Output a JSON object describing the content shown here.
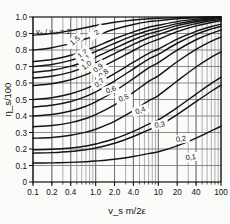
{
  "chart_data": {
    "type": "line",
    "title": "",
    "xlabel": "v_s m/2ε",
    "ylabel": "η_s/100",
    "xscale": "log",
    "xlim": [
      0.1,
      100
    ],
    "ylim": [
      0,
      1.0
    ],
    "grid": true,
    "legend_position": "inline-curve-labels",
    "legend_title": "vₛ / vₛₜ = 2",
    "xticks": [
      "0.1",
      "0.2",
      "0.4",
      "1.0",
      "2.0",
      "4.0",
      "10",
      "20",
      "40",
      "100"
    ],
    "xtick_values": [
      0.1,
      0.2,
      0.4,
      1.0,
      2.0,
      4.0,
      10,
      20,
      40,
      100
    ],
    "yticks": [
      "0",
      "0.1",
      "0.2",
      "0.3",
      "0.4",
      "0.5",
      "0.6",
      "0.7",
      "0.8",
      "0.9",
      "1.0"
    ],
    "ytick_values": [
      0,
      0.1,
      0.2,
      0.3,
      0.4,
      0.5,
      0.6,
      0.7,
      0.8,
      0.9,
      1.0
    ],
    "series": [
      {
        "name": "2",
        "label": "2",
        "label_x": 1.05,
        "label_y": 0.905,
        "x": [
          0.1,
          0.2,
          0.4,
          0.7,
          1.0,
          2.0,
          4.0,
          7.0,
          10,
          20,
          40,
          70,
          100
        ],
        "values": [
          0.89,
          0.9,
          0.918,
          0.936,
          0.948,
          0.968,
          0.982,
          0.989,
          0.992,
          0.996,
          0.999,
          1.0,
          1.0
        ]
      },
      {
        "name": "1.5",
        "label": "1,5",
        "label_x": 0.47,
        "label_y": 0.855,
        "x": [
          0.1,
          0.2,
          0.4,
          0.7,
          1.0,
          2.0,
          4.0,
          7.0,
          10,
          20,
          40,
          70,
          100
        ],
        "values": [
          0.8,
          0.814,
          0.84,
          0.868,
          0.888,
          0.926,
          0.955,
          0.972,
          0.978,
          0.989,
          0.996,
          0.999,
          1.0
        ]
      },
      {
        "name": "1.2",
        "label": "1,2",
        "label_x": 0.62,
        "label_y": 0.775,
        "x": [
          0.1,
          0.2,
          0.4,
          0.7,
          1.0,
          2.0,
          4.0,
          7.0,
          10,
          20,
          40,
          70,
          100
        ],
        "values": [
          0.73,
          0.742,
          0.768,
          0.798,
          0.82,
          0.868,
          0.91,
          0.938,
          0.95,
          0.972,
          0.987,
          0.995,
          0.998
        ]
      },
      {
        "name": "1.1",
        "label": "1,1",
        "label_x": 0.7,
        "label_y": 0.742,
        "x": [
          0.1,
          0.2,
          0.4,
          0.7,
          1.0,
          2.0,
          4.0,
          7.0,
          10,
          20,
          40,
          70,
          100
        ],
        "values": [
          0.7,
          0.712,
          0.737,
          0.767,
          0.79,
          0.84,
          0.887,
          0.918,
          0.932,
          0.96,
          0.979,
          0.99,
          0.995
        ]
      },
      {
        "name": "1.0",
        "label": "1,0",
        "label_x": 0.72,
        "label_y": 0.706,
        "x": [
          0.1,
          0.2,
          0.4,
          0.7,
          1.0,
          2.0,
          4.0,
          7.0,
          10,
          20,
          40,
          70,
          100
        ],
        "values": [
          0.665,
          0.677,
          0.702,
          0.733,
          0.757,
          0.81,
          0.862,
          0.898,
          0.914,
          0.948,
          0.971,
          0.985,
          0.991
        ]
      },
      {
        "name": "0.9",
        "label": "0,9",
        "label_x": 1.1,
        "label_y": 0.69,
        "x": [
          0.1,
          0.2,
          0.4,
          0.7,
          1.0,
          2.0,
          4.0,
          7.0,
          10,
          20,
          40,
          70,
          100
        ],
        "values": [
          0.63,
          0.641,
          0.666,
          0.697,
          0.722,
          0.778,
          0.834,
          0.874,
          0.893,
          0.932,
          0.96,
          0.977,
          0.985
        ]
      },
      {
        "name": "0.8",
        "label": "0,8",
        "label_x": 1.35,
        "label_y": 0.655,
        "x": [
          0.1,
          0.2,
          0.4,
          0.7,
          1.0,
          2.0,
          4.0,
          7.0,
          10,
          20,
          40,
          70,
          100
        ],
        "values": [
          0.585,
          0.596,
          0.62,
          0.651,
          0.677,
          0.736,
          0.797,
          0.843,
          0.864,
          0.911,
          0.946,
          0.967,
          0.977
        ]
      },
      {
        "name": "0.7",
        "label": "0,7",
        "label_x": 1.15,
        "label_y": 0.6,
        "x": [
          0.1,
          0.2,
          0.4,
          0.7,
          1.0,
          2.0,
          4.0,
          7.0,
          10,
          20,
          40,
          70,
          100
        ],
        "values": [
          0.5,
          0.511,
          0.535,
          0.566,
          0.593,
          0.657,
          0.726,
          0.78,
          0.806,
          0.866,
          0.913,
          0.942,
          0.956
        ]
      },
      {
        "name": "0.6",
        "label": "0,6",
        "label_x": 1.75,
        "label_y": 0.558,
        "x": [
          0.1,
          0.2,
          0.4,
          0.7,
          1.0,
          2.0,
          4.0,
          7.0,
          10,
          20,
          40,
          70,
          100
        ],
        "values": [
          0.455,
          0.465,
          0.488,
          0.519,
          0.546,
          0.612,
          0.686,
          0.745,
          0.774,
          0.841,
          0.895,
          0.928,
          0.944
        ]
      },
      {
        "name": "0.5",
        "label": "0,5",
        "label_x": 2.8,
        "label_y": 0.508,
        "x": [
          0.1,
          0.2,
          0.4,
          0.7,
          1.0,
          2.0,
          4.0,
          7.0,
          10,
          20,
          40,
          70,
          100
        ],
        "values": [
          0.4,
          0.409,
          0.43,
          0.459,
          0.485,
          0.55,
          0.627,
          0.692,
          0.723,
          0.799,
          0.862,
          0.901,
          0.921
        ]
      },
      {
        "name": "0.4",
        "label": "0,4",
        "label_x": 5.2,
        "label_y": 0.432,
        "x": [
          0.1,
          0.2,
          0.4,
          0.7,
          1.0,
          2.0,
          4.0,
          7.0,
          10,
          20,
          40,
          70,
          100
        ],
        "values": [
          0.335,
          0.342,
          0.36,
          0.385,
          0.408,
          0.468,
          0.543,
          0.61,
          0.643,
          0.729,
          0.804,
          0.853,
          0.878
        ]
      },
      {
        "name": "0.3",
        "label": "0,3",
        "label_x": 10.5,
        "label_y": 0.345,
        "x": [
          0.1,
          0.2,
          0.4,
          0.7,
          1.0,
          2.0,
          4.0,
          7.0,
          10,
          20,
          40,
          70,
          100
        ],
        "values": [
          0.265,
          0.27,
          0.283,
          0.302,
          0.32,
          0.368,
          0.432,
          0.492,
          0.524,
          0.612,
          0.697,
          0.757,
          0.789
        ]
      },
      {
        "name": "0.2",
        "label": "0,2",
        "label_x": 23.0,
        "label_y": 0.258,
        "x": [
          0.1,
          0.2,
          0.4,
          0.7,
          1.0,
          2.0,
          4.0,
          7.0,
          10,
          20,
          40,
          70,
          100
        ],
        "values": [
          0.195,
          0.198,
          0.206,
          0.218,
          0.23,
          0.262,
          0.307,
          0.351,
          0.376,
          0.451,
          0.533,
          0.598,
          0.635
        ]
      },
      {
        "name": "0.2b",
        "label": "",
        "label_x": 0,
        "label_y": 0,
        "x": [
          0.1,
          0.2,
          0.4,
          0.7,
          1.0,
          2.0,
          4.0,
          7.0,
          10,
          20,
          40,
          70,
          100
        ],
        "values": [
          0.175,
          0.178,
          0.185,
          0.196,
          0.206,
          0.235,
          0.276,
          0.316,
          0.339,
          0.409,
          0.487,
          0.55,
          0.587
        ]
      },
      {
        "name": "0.1",
        "label": "0,1",
        "label_x": 33.0,
        "label_y": 0.148,
        "x": [
          0.1,
          0.2,
          0.4,
          0.7,
          1.0,
          2.0,
          4.0,
          7.0,
          10,
          20,
          40,
          70,
          100
        ],
        "values": [
          0.115,
          0.116,
          0.119,
          0.123,
          0.127,
          0.138,
          0.155,
          0.172,
          0.183,
          0.219,
          0.266,
          0.31,
          0.338
        ]
      }
    ]
  },
  "colors": {
    "curve": "#141414",
    "grid": "#6e6e6e",
    "frame": "#111111",
    "text": "#111111",
    "background": "#fbfbfa"
  }
}
